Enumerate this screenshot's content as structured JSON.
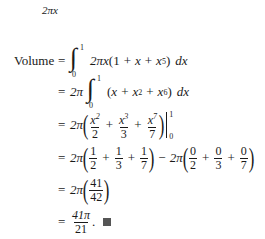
{
  "top_label": "2πx",
  "volume": {
    "lhs": "Volume",
    "eq": "=",
    "steps": [
      {
        "id": "step1",
        "text": "∫₀¹ 2πx(1 + x + x⁵) dx"
      },
      {
        "id": "step2",
        "text": "2π ∫₀¹ (x + x² + x⁶) dx"
      },
      {
        "id": "step3",
        "text": "2π(x²/2 + x³/3 + x⁷/7) |₀¹"
      },
      {
        "id": "step4",
        "text": "2π(1/2 + 1/3 + 1/7) − 2π(0/2 + 0/3 + 0/7)"
      },
      {
        "id": "step5",
        "text": "2π(41/42)"
      },
      {
        "id": "step6",
        "text": "41π/21. ■"
      }
    ]
  },
  "tokens": {
    "two_pi": "2π",
    "two_pi_x": "2πx",
    "x": "x",
    "dx": "dx",
    "plus": "+",
    "minus": "−",
    "one": "1",
    "zero": "0",
    "lower": "0",
    "upper": "1",
    "integral": "∫",
    "lparen": "(",
    "rparen": ")",
    "n2": "2",
    "n3": "3",
    "n5": "5",
    "n6": "6",
    "n7": "7",
    "n41": "41",
    "n42": "42",
    "n21": "21",
    "pi41": "41π",
    "period": "."
  }
}
